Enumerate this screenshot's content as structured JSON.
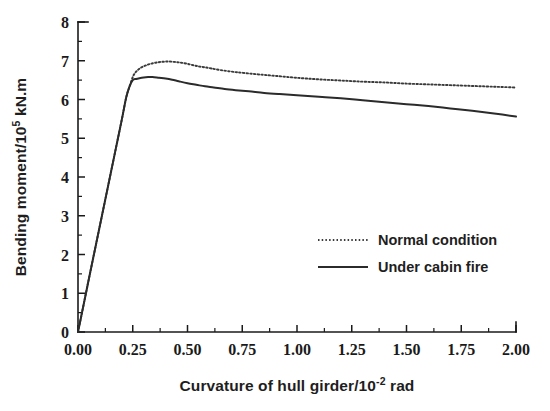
{
  "chart_data": {
    "type": "line",
    "title": "",
    "xlabel": "Curvature of hull girder/10-2 rad",
    "xlabel_parts": {
      "pre": "Curvature of hull girder/10",
      "sup": "-2",
      "post": " rad"
    },
    "ylabel": "Bending moment/105 kN.m",
    "ylabel_parts": {
      "pre": "Bending moment/10",
      "sup": "5",
      "post": " kN.m"
    },
    "xlim": [
      0.0,
      2.0
    ],
    "ylim": [
      0,
      8
    ],
    "xticks": [
      "0.00",
      "0.25",
      "0.50",
      "0.75",
      "1.00",
      "1.25",
      "1.50",
      "1.75",
      "2.00"
    ],
    "xtick_values": [
      0.0,
      0.25,
      0.5,
      0.75,
      1.0,
      1.25,
      1.5,
      1.75,
      2.0
    ],
    "x_minor_step": 0.125,
    "yticks": [
      "0",
      "1",
      "2",
      "3",
      "4",
      "5",
      "6",
      "7",
      "8"
    ],
    "ytick_values": [
      0,
      1,
      2,
      3,
      4,
      5,
      6,
      7,
      8
    ],
    "y_minor_step": 0.5,
    "grid": false,
    "legend_position": "center right",
    "series": [
      {
        "name": "Normal condition",
        "style": "dotted",
        "color": "#3a3a3a",
        "x": [
          0.0,
          0.02,
          0.05,
          0.08,
          0.11,
          0.14,
          0.17,
          0.2,
          0.22,
          0.235,
          0.25,
          0.26,
          0.275,
          0.29,
          0.31,
          0.33,
          0.355,
          0.38,
          0.41,
          0.44,
          0.47,
          0.5,
          0.53,
          0.555,
          0.58,
          0.61,
          0.65,
          0.7,
          0.75,
          0.82,
          0.9,
          1.0,
          1.1,
          1.2,
          1.3,
          1.4,
          1.5,
          1.6,
          1.7,
          1.8,
          1.9,
          2.0
        ],
        "y": [
          0.0,
          0.55,
          1.38,
          2.2,
          3.02,
          3.84,
          4.66,
          5.48,
          6.05,
          6.33,
          6.58,
          6.68,
          6.77,
          6.83,
          6.88,
          6.92,
          6.95,
          6.97,
          6.98,
          6.97,
          6.95,
          6.92,
          6.88,
          6.85,
          6.83,
          6.8,
          6.76,
          6.72,
          6.69,
          6.65,
          6.61,
          6.56,
          6.52,
          6.49,
          6.46,
          6.44,
          6.41,
          6.39,
          6.37,
          6.35,
          6.33,
          6.31
        ]
      },
      {
        "name": "Under cabin fire",
        "style": "solid",
        "color": "#2b2b2b",
        "x": [
          0.0,
          0.02,
          0.05,
          0.08,
          0.11,
          0.14,
          0.17,
          0.2,
          0.22,
          0.235,
          0.25,
          0.265,
          0.28,
          0.3,
          0.32,
          0.34,
          0.37,
          0.4,
          0.43,
          0.46,
          0.5,
          0.54,
          0.58,
          0.62,
          0.67,
          0.72,
          0.78,
          0.85,
          0.92,
          1.0,
          1.1,
          1.2,
          1.3,
          1.4,
          1.5,
          1.6,
          1.7,
          1.8,
          1.9,
          2.0
        ],
        "y": [
          0.0,
          0.55,
          1.38,
          2.2,
          3.02,
          3.84,
          4.66,
          5.48,
          6.05,
          6.33,
          6.5,
          6.53,
          6.55,
          6.57,
          6.58,
          6.58,
          6.56,
          6.54,
          6.51,
          6.47,
          6.42,
          6.38,
          6.34,
          6.31,
          6.27,
          6.24,
          6.21,
          6.17,
          6.14,
          6.11,
          6.07,
          6.03,
          5.98,
          5.93,
          5.88,
          5.83,
          5.77,
          5.71,
          5.64,
          5.56
        ]
      }
    ],
    "legend": [
      {
        "label": "Normal condition",
        "style": "dotted"
      },
      {
        "label": "Under cabin fire",
        "style": "solid"
      }
    ]
  }
}
